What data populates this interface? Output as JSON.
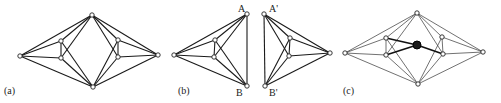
{
  "figure": {
    "panels": [
      {
        "id": "a",
        "label": "(a)",
        "label_pos": [
          4,
          91
        ],
        "nodes": {
          "T": [
            92,
            15
          ],
          "L": [
            20,
            56
          ],
          "B": [
            93,
            87
          ],
          "IL1": [
            61,
            41
          ],
          "IL2": [
            61,
            58
          ],
          "IR1": [
            118,
            40
          ],
          "IR2": [
            118,
            57
          ],
          "R": [
            158,
            55
          ]
        },
        "edges": [
          [
            "L",
            "T"
          ],
          [
            "L",
            "B"
          ],
          [
            "L",
            "IL1"
          ],
          [
            "L",
            "IL2"
          ],
          [
            "IL1",
            "IL2"
          ],
          [
            "IL1",
            "T"
          ],
          [
            "IL1",
            "B"
          ],
          [
            "IL2",
            "T"
          ],
          [
            "IL2",
            "B"
          ],
          [
            "R",
            "T"
          ],
          [
            "R",
            "B"
          ],
          [
            "R",
            "IR1"
          ],
          [
            "R",
            "IR2"
          ],
          [
            "IR1",
            "IR2"
          ],
          [
            "IR1",
            "T"
          ],
          [
            "IR1",
            "B"
          ],
          [
            "IR2",
            "T"
          ],
          [
            "IR2",
            "B"
          ]
        ],
        "style": "normal"
      },
      {
        "id": "b",
        "label": "(b)",
        "label_pos": [
          178,
          91
        ],
        "nodes": {
          "A": [
            247,
            14
          ],
          "B": [
            247,
            86
          ],
          "L": [
            174,
            55
          ],
          "I1": [
            215,
            40
          ],
          "I2": [
            214,
            57
          ]
        },
        "edges": [
          [
            "L",
            "A"
          ],
          [
            "L",
            "B"
          ],
          [
            "L",
            "I1"
          ],
          [
            "L",
            "I2"
          ],
          [
            "I1",
            "I2"
          ],
          [
            "I1",
            "A"
          ],
          [
            "I1",
            "B"
          ],
          [
            "I2",
            "A"
          ],
          [
            "I2",
            "B"
          ],
          [
            "A",
            "B"
          ]
        ],
        "node_labels": [
          {
            "text": "A",
            "pos": [
              239,
              13
            ]
          },
          {
            "text": "B'",
            "pos": [
              0,
              0
            ],
            "hidden": true
          },
          {
            "text": "B",
            "pos": [
              237,
              93
            ]
          }
        ],
        "style": "normal"
      },
      {
        "id": "b2",
        "label": "",
        "nodes": {
          "A": [
            264,
            14
          ],
          "B": [
            265,
            86
          ],
          "R": [
            330,
            53
          ],
          "I1": [
            290,
            38
          ],
          "I2": [
            289,
            56
          ]
        },
        "edges": [
          [
            "R",
            "A"
          ],
          [
            "R",
            "B"
          ],
          [
            "R",
            "I1"
          ],
          [
            "R",
            "I2"
          ],
          [
            "I1",
            "I2"
          ],
          [
            "I1",
            "A"
          ],
          [
            "I1",
            "B"
          ],
          [
            "I2",
            "A"
          ],
          [
            "I2",
            "B"
          ],
          [
            "A",
            "B"
          ]
        ],
        "node_labels": [
          {
            "text": "A'",
            "pos": [
              270,
              13
            ]
          },
          {
            "text": "B'",
            "pos": [
              270,
              93
            ]
          }
        ],
        "style": "normal"
      },
      {
        "id": "c",
        "label": "(c)",
        "label_pos": [
          343,
          91
        ],
        "nodes": {
          "T": [
            417,
            13
          ],
          "L": [
            345,
            53
          ],
          "B": [
            418,
            84
          ],
          "IL1": [
            386,
            38
          ],
          "IL2": [
            386,
            55
          ],
          "IR1": [
            442,
            37
          ],
          "IR2": [
            443,
            54
          ],
          "R": [
            483,
            52
          ]
        },
        "center": [
          417,
          45
        ],
        "edges": [
          [
            "L",
            "T"
          ],
          [
            "L",
            "B"
          ],
          [
            "L",
            "IL1"
          ],
          [
            "L",
            "IL2"
          ],
          [
            "IL1",
            "IL2"
          ],
          [
            "IL1",
            "T"
          ],
          [
            "IL1",
            "B"
          ],
          [
            "IL2",
            "T"
          ],
          [
            "IL2",
            "B"
          ],
          [
            "R",
            "T"
          ],
          [
            "R",
            "B"
          ],
          [
            "R",
            "IR1"
          ],
          [
            "R",
            "IR2"
          ],
          [
            "IR1",
            "IR2"
          ],
          [
            "IR1",
            "T"
          ],
          [
            "IR1",
            "B"
          ],
          [
            "IR2",
            "T"
          ],
          [
            "IR2",
            "B"
          ]
        ],
        "bold_edges_to_center": [
          "IL1",
          "IL2",
          "IR2"
        ],
        "style": "thin"
      }
    ],
    "colors": {
      "background": "#ffffff",
      "stroke": "#1a1a1a",
      "center_fill": "#1a1a1a"
    }
  }
}
